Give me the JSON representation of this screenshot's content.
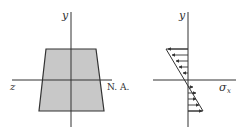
{
  "diagram": {
    "cross_section": {
      "shape": "trapezoid",
      "fill_color": "#c8c8c8",
      "stroke_color": "#333333",
      "y_axis_label": "y",
      "z_axis_label": "z",
      "neutral_axis_label": "N. A."
    },
    "stress_diagram": {
      "y_axis_label": "y",
      "stress_axis_label_main": "σ",
      "stress_axis_label_sub": "x",
      "top_arrows_direction": "left",
      "bottom_arrows_direction": "right",
      "arrow_count_top": 5,
      "arrow_count_bottom": 5
    },
    "colors": {
      "line": "#333333",
      "fill": "#c8c8c8",
      "background": "#ffffff"
    }
  }
}
